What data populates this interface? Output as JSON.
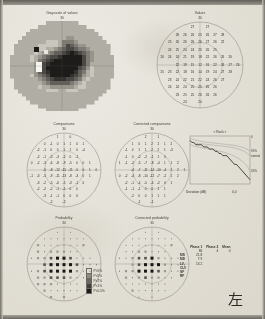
{
  "document": {
    "kind": "perimetry-printout",
    "eye_marker": "左",
    "paper_color": "#e4e1d8",
    "ink_color": "#33312d"
  },
  "panels": {
    "grayscale": {
      "title": "Grayscale of values",
      "degrees": "30"
    },
    "values": {
      "title": "Values",
      "degrees": "30"
    },
    "comparisons": {
      "title": "Comparisons",
      "degrees": "30"
    },
    "corrected_comparisons": {
      "title": "Corrected comparisons",
      "degrees": "30"
    },
    "probability": {
      "title": "Probability",
      "degrees": "30"
    },
    "corrected_probability": {
      "title": "Corrected probability",
      "degrees": "30"
    },
    "bebie": {
      "title": "Rank",
      "ylabel_top": "0",
      "xlabel": "Deviation (dB)",
      "xvalue": "0,0",
      "band_labels": [
        "95%",
        "normal",
        "05%"
      ]
    }
  },
  "probability_legend": [
    {
      "label": "P>5%",
      "color": "#e4e1d8",
      "shape": "open"
    },
    {
      "label": "P<5%",
      "color": "#8d8a83",
      "shape": "half"
    },
    {
      "label": "P<2%",
      "color": "#6a6761",
      "shape": "dense"
    },
    {
      "label": "P<1%",
      "color": "#403e3a",
      "shape": "denser"
    },
    {
      "label": "P<0.5%",
      "color": "#1c1b19",
      "shape": "solid"
    }
  ],
  "stats_table": {
    "columns": [
      "",
      "Phase 1",
      "Phase 2",
      "Mean"
    ],
    "header_values": [
      "",
      "86",
      "4",
      "0"
    ],
    "rows": [
      {
        "label": "MS",
        "phase1": "21.8",
        "phase2": "",
        "mean": ""
      },
      {
        "label": "MD",
        "phase1": "7.9",
        "phase2": "",
        "mean": ""
      },
      {
        "label": "LV",
        "phase1": "13.2",
        "phase2": "",
        "mean": ""
      },
      {
        "label": "CLV",
        "phase1": "",
        "phase2": "",
        "mean": ""
      },
      {
        "label": "SF",
        "phase1": "",
        "phase2": "",
        "mean": ""
      },
      {
        "label": "RF",
        "phase1": "",
        "phase2": "",
        "mean": ""
      }
    ]
  },
  "chart_data": [
    {
      "type": "heatmap",
      "title": "Grayscale of values",
      "note": "Octopus 30-degree grayscale sensitivity map, left eye",
      "grid_cols": 26,
      "grid_rows": 24,
      "levels": [
        {
          "name": "level-0",
          "color": "#f2f0ea"
        },
        {
          "name": "level-1",
          "color": "#dedbd3"
        },
        {
          "name": "level-2",
          "color": "#c9c6bd"
        },
        {
          "name": "level-3",
          "color": "#b0ada4"
        },
        {
          "name": "level-4",
          "color": "#97948c"
        },
        {
          "name": "level-5",
          "color": "#7e7b74"
        },
        {
          "name": "level-6",
          "color": "#63605b"
        },
        {
          "name": "level-7",
          "color": "#4a4844"
        },
        {
          "name": "level-8",
          "color": "#33322f"
        },
        {
          "name": "level-9",
          "color": "#1d1c1b"
        }
      ]
    },
    {
      "type": "table",
      "title": "Values",
      "units": "dB",
      "layout": "octopus-59-point-grid",
      "values": [
        [
          null,
          null,
          null,
          null,
          27,
          null,
          27,
          null,
          null,
          null,
          null
        ],
        [
          null,
          null,
          28,
          26,
          26,
          25,
          26,
          27,
          28,
          null,
          null
        ],
        [
          null,
          25,
          26,
          26,
          26,
          26,
          27,
          26,
          22,
          null,
          null
        ],
        [
          null,
          24,
          25,
          24,
          24,
          25,
          26,
          25,
          null,
          null,
          null
        ],
        [
          26,
          24,
          24,
          21,
          19,
          18,
          22,
          26,
          26,
          26,
          null
        ],
        [
          null,
          null,
          22,
          19,
          15,
          12,
          16,
          22,
          26,
          27,
          26
        ],
        [
          25,
          23,
          22,
          18,
          16,
          14,
          19,
          24,
          27,
          28,
          null
        ],
        [
          null,
          23,
          24,
          22,
          21,
          22,
          24,
          26,
          27,
          null,
          null
        ],
        [
          null,
          24,
          24,
          24,
          25,
          25,
          26,
          26,
          null,
          null,
          null
        ],
        [
          null,
          null,
          23,
          25,
          25,
          26,
          26,
          26,
          null,
          null,
          null
        ],
        [
          null,
          null,
          null,
          24,
          null,
          24,
          null,
          null,
          null,
          null,
          null
        ]
      ]
    },
    {
      "type": "table",
      "title": "Comparisons",
      "units": "dB deviation",
      "values": [
        [
          null,
          null,
          null,
          null,
          1,
          null,
          0,
          null,
          null,
          null,
          null
        ],
        [
          null,
          null,
          0,
          -1,
          0,
          1,
          1,
          0,
          1,
          null,
          null
        ],
        [
          null,
          -2,
          -1,
          0,
          0,
          1,
          1,
          0,
          -4,
          null,
          null
        ],
        [
          null,
          -2,
          -1,
          -3,
          -3,
          -2,
          0,
          -1,
          null,
          null,
          null
        ],
        [
          0,
          -2,
          -3,
          -6,
          -8,
          -9,
          -5,
          0,
          0,
          1,
          null
        ],
        [
          null,
          null,
          -5,
          -8,
          -12,
          -15,
          -11,
          -5,
          0,
          1,
          0
        ],
        [
          -1,
          -3,
          -5,
          -9,
          -11,
          -13,
          -8,
          -3,
          0,
          1,
          null
        ],
        [
          null,
          -3,
          -2,
          -5,
          -6,
          -5,
          -3,
          -1,
          0,
          null,
          null
        ],
        [
          null,
          -2,
          -2,
          -2,
          -1,
          -1,
          0,
          0,
          null,
          null,
          null
        ],
        [
          null,
          null,
          -3,
          -1,
          -1,
          0,
          0,
          0,
          null,
          null,
          null
        ],
        [
          null,
          null,
          null,
          -2,
          null,
          -2,
          null,
          null,
          null,
          null,
          null
        ]
      ]
    },
    {
      "type": "table",
      "title": "Corrected comparisons",
      "units": "dB deviation",
      "values": [
        [
          null,
          null,
          null,
          null,
          2,
          null,
          1,
          null,
          null,
          null,
          null
        ],
        [
          null,
          null,
          1,
          0,
          1,
          2,
          2,
          1,
          2,
          null,
          null
        ],
        [
          null,
          -1,
          0,
          1,
          1,
          2,
          2,
          1,
          -3,
          null,
          null
        ],
        [
          null,
          -1,
          0,
          -2,
          -2,
          -1,
          1,
          0,
          null,
          null,
          null
        ],
        [
          1,
          -1,
          -2,
          -5,
          -7,
          -8,
          -4,
          1,
          1,
          2,
          null
        ],
        [
          null,
          null,
          -4,
          -7,
          -11,
          -14,
          -10,
          -4,
          1,
          2,
          1
        ],
        [
          0,
          -2,
          -4,
          -8,
          -10,
          -12,
          -7,
          -2,
          1,
          2,
          null
        ],
        [
          null,
          -2,
          -1,
          -4,
          -5,
          -4,
          -2,
          0,
          1,
          null,
          null
        ],
        [
          null,
          -1,
          -1,
          -1,
          0,
          0,
          1,
          1,
          null,
          null,
          null
        ],
        [
          null,
          null,
          -2,
          0,
          0,
          1,
          1,
          1,
          null,
          null,
          null
        ],
        [
          null,
          null,
          null,
          -1,
          null,
          -1,
          null,
          null,
          null,
          null,
          null
        ]
      ]
    },
    {
      "type": "line",
      "title": "Bebie curve",
      "xlabel": "Rank",
      "ylabel": "Deviation (dB)",
      "series": [
        {
          "name": "patient",
          "values": [
            2,
            1,
            1,
            0,
            0,
            0,
            0,
            -1,
            -1,
            -1,
            -2,
            -2,
            -2,
            -3,
            -3,
            -4,
            -4,
            -5,
            -5,
            -5,
            -6,
            -7,
            -8,
            -9,
            -9,
            -10,
            -11,
            -12,
            -13,
            -14,
            -15,
            -16
          ]
        },
        {
          "name": "95%",
          "values": [
            3,
            2.6,
            2.3,
            2.1,
            1.9,
            1.7,
            1.5,
            1.4,
            1.2,
            1.1,
            1,
            0.9,
            0.8,
            0.7,
            0.6,
            0.5,
            0.4,
            0.3,
            0.2,
            0.1,
            0,
            -0.1,
            -0.2,
            -0.3,
            -0.5,
            -0.7,
            -0.9,
            -1.2,
            -1.5,
            -1.9,
            -2.4,
            -3
          ]
        },
        {
          "name": "normal",
          "values": [
            1.5,
            1.2,
            1,
            0.8,
            0.6,
            0.5,
            0.4,
            0.3,
            0.2,
            0.1,
            0,
            -0.1,
            -0.2,
            -0.3,
            -0.4,
            -0.5,
            -0.6,
            -0.7,
            -0.8,
            -0.9,
            -1,
            -1.1,
            -1.3,
            -1.5,
            -1.7,
            -2,
            -2.3,
            -2.7,
            -3.1,
            -3.6,
            -4.2,
            -5
          ]
        },
        {
          "name": "05%",
          "values": [
            0,
            -0.3,
            -0.6,
            -0.8,
            -1,
            -1.2,
            -1.4,
            -1.5,
            -1.7,
            -1.8,
            -2,
            -2.1,
            -2.3,
            -2.5,
            -2.7,
            -2.9,
            -3.1,
            -3.3,
            -3.6,
            -3.9,
            -4.2,
            -4.5,
            -4.9,
            -5.3,
            -5.8,
            -6.3,
            -6.9,
            -7.6,
            -8.4,
            -9.3,
            -10.4,
            -12
          ]
        }
      ]
    }
  ]
}
